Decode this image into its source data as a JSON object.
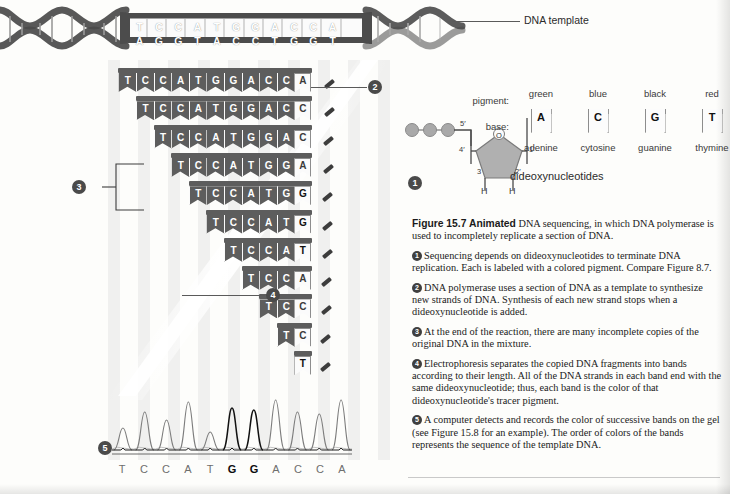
{
  "figure": {
    "number": "Figure 15.7",
    "animated_label": "Animated",
    "title": "DNA sequencing, in which DNA polymerase is used to incompletely replicate a section of DNA.",
    "steps": [
      {
        "n": "1",
        "text": "Sequencing depends on dideoxynucleotides to terminate DNA replication. Each is labeled with a colored pigment. Compare Figure 8.7."
      },
      {
        "n": "2",
        "text": "DNA polymerase uses a section of DNA as a template to synthesize new strands of DNA. Synthesis of each new strand stops when a dideoxynucleotide is added."
      },
      {
        "n": "3",
        "text": "At the end of the reaction, there are many incomplete copies of the original DNA in the mixture."
      },
      {
        "n": "4",
        "text": "Electrophoresis separates the copied DNA fragments into bands according to their length. All of the DNA strands in each band end with the same dideoxynucleotide; thus, each band is the color of that dideoxynucleotide's tracer pigment."
      },
      {
        "n": "5",
        "text": "A computer detects and records the color of successive bands on the gel (see Figure 15.8 for an example). The order of colors of the bands represents the sequence of the template DNA."
      }
    ]
  },
  "template": {
    "label": "DNA template",
    "top_strand": [
      "T",
      "C",
      "C",
      "A",
      "T",
      "G",
      "G",
      "A",
      "C",
      "C",
      "A"
    ],
    "bottom_strand": [
      "A",
      "G",
      "G",
      "T",
      "A",
      "C",
      "C",
      "T",
      "G",
      "G",
      "T"
    ]
  },
  "ladder": {
    "rows": [
      {
        "bases": [
          "T",
          "C",
          "C",
          "A",
          "T",
          "G",
          "G",
          "A",
          "C",
          "C"
        ],
        "terminator": "A"
      },
      {
        "bases": [
          "T",
          "C",
          "C",
          "A",
          "T",
          "G",
          "G",
          "A",
          "C"
        ],
        "terminator": "C"
      },
      {
        "bases": [
          "T",
          "C",
          "C",
          "A",
          "T",
          "G",
          "G",
          "A"
        ],
        "terminator": "C"
      },
      {
        "bases": [
          "T",
          "C",
          "C",
          "A",
          "T",
          "G",
          "G"
        ],
        "terminator": "A"
      },
      {
        "bases": [
          "T",
          "C",
          "C",
          "A",
          "T",
          "G"
        ],
        "terminator": "G"
      },
      {
        "bases": [
          "T",
          "C",
          "C",
          "A",
          "T"
        ],
        "terminator": "G"
      },
      {
        "bases": [
          "T",
          "C",
          "C",
          "A"
        ],
        "terminator": "T"
      },
      {
        "bases": [
          "T",
          "C",
          "C"
        ],
        "terminator": "A"
      },
      {
        "bases": [
          "T",
          "C"
        ],
        "terminator": "C"
      },
      {
        "bases": [
          "T"
        ],
        "terminator": "C"
      },
      {
        "bases": [],
        "terminator": "T"
      }
    ]
  },
  "callouts": {
    "c1": "1",
    "c2": "2",
    "c3": "3",
    "c4": "4",
    "c5": "5"
  },
  "dideoxynucleotides": {
    "caption": "dideoxynucleotides",
    "row_headers": {
      "pigment": "pigment:",
      "base": "base:"
    },
    "items": [
      {
        "pigment": "green",
        "letter": "A",
        "name": "adenine",
        "cap_color": "#6f6f6f"
      },
      {
        "pigment": "blue",
        "letter": "C",
        "name": "cytosine",
        "cap_color": "#4a4a4a"
      },
      {
        "pigment": "black",
        "letter": "G",
        "name": "guanine",
        "cap_color": "#2b2b2b"
      },
      {
        "pigment": "red",
        "letter": "T",
        "name": "thymine",
        "cap_color": "#8a8a8a"
      }
    ]
  },
  "sugar": {
    "labels": {
      "five_prime": "5'",
      "four_prime": "4'",
      "three_prime": "3",
      "two_prime": "2'",
      "one_prime": "1'",
      "oxygen": "O",
      "h_left": "H",
      "h_right": "H"
    }
  },
  "chart_data": {
    "type": "line",
    "xlabel": "",
    "ylabel": "",
    "grid": false,
    "legend": "none",
    "categories": [
      "T",
      "C",
      "C",
      "A",
      "T",
      "G",
      "G",
      "A",
      "C",
      "C",
      "A"
    ],
    "bold_positions": [
      5,
      6
    ],
    "series": [
      {
        "name": "trace",
        "peak_heights": [
          22,
          38,
          30,
          48,
          18,
          42,
          40,
          50,
          38,
          36,
          50
        ],
        "peak_colors": [
          "#7d7d7d",
          "#7d7d7d",
          "#7d7d7d",
          "#7d7d7d",
          "#7d7d7d",
          "#111111",
          "#111111",
          "#7d7d7d",
          "#7d7d7d",
          "#7d7d7d",
          "#7d7d7d"
        ]
      }
    ],
    "ylim": [
      0,
      56
    ],
    "baseline_label": ""
  }
}
